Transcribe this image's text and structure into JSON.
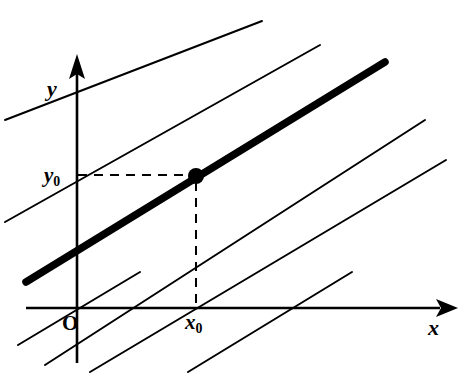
{
  "figure": {
    "type": "geometry-diagram",
    "background_color": "#ffffff",
    "stroke_color": "#000000"
  },
  "axes": {
    "x_axis": {
      "label": "x",
      "arrow": true,
      "from": [
        26,
        308
      ],
      "to": [
        440,
        308
      ]
    },
    "y_axis": {
      "label": "y",
      "arrow": true,
      "from": [
        77,
        363
      ],
      "to": [
        77,
        74
      ]
    },
    "origin": {
      "label": "O",
      "position": [
        77,
        308
      ]
    }
  },
  "ticks": {
    "x0": {
      "label": "x",
      "subscript": "0",
      "value_position": [
        196,
        308
      ]
    },
    "y0": {
      "label": "y",
      "subscript": "0",
      "value_position": [
        77,
        175
      ]
    }
  },
  "point": {
    "name": "marked-point",
    "coords_label": "(x0, y0)",
    "position": [
      196,
      176
    ],
    "radius": 8,
    "fill": "#000000"
  },
  "guides": {
    "horizontal_dashed": {
      "from": [
        78,
        175
      ],
      "to": [
        196,
        175
      ]
    },
    "vertical_dashed": {
      "from": [
        196,
        182
      ],
      "to": [
        196,
        308
      ]
    },
    "dash_pattern": "9 7",
    "stroke_width": 2
  },
  "chart_data": {
    "type": "line",
    "title": "",
    "xlabel": "x",
    "ylabel": "y",
    "slope": 0.55,
    "highlighted_line_index": 2,
    "lines": [
      {
        "name": "parallel-line-1",
        "bold": false,
        "width": 2.0,
        "x1": 5,
        "y1": 120,
        "x2": 262,
        "y2": 21
      },
      {
        "name": "parallel-line-2",
        "bold": false,
        "width": 2.0,
        "x1": 5,
        "y1": 222,
        "x2": 320,
        "y2": 45
      },
      {
        "name": "bold-line",
        "bold": true,
        "width": 7.5,
        "x1": 26,
        "y1": 282,
        "x2": 385,
        "y2": 62
      },
      {
        "name": "parallel-line-4",
        "bold": false,
        "width": 2.0,
        "x1": 45,
        "y1": 365,
        "x2": 425,
        "y2": 120
      },
      {
        "name": "parallel-line-5",
        "bold": false,
        "width": 2.0,
        "x1": 90,
        "y1": 372,
        "x2": 446,
        "y2": 160
      },
      {
        "name": "parallel-line-6",
        "bold": false,
        "width": 2.0,
        "x1": 18,
        "y1": 345,
        "x2": 140,
        "y2": 272
      },
      {
        "name": "parallel-line-7",
        "bold": false,
        "width": 2.0,
        "x1": 188,
        "y1": 372,
        "x2": 352,
        "y2": 272
      }
    ]
  }
}
